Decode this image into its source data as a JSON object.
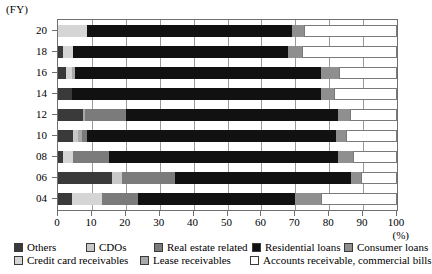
{
  "axis": {
    "y_axis_title": "(FY)",
    "x_axis_unit": "(%)",
    "x_ticks": [
      0,
      10,
      20,
      30,
      40,
      50,
      60,
      70,
      80,
      90,
      100
    ],
    "y_ticks": [
      "20",
      "18",
      "16",
      "14",
      "12",
      "10",
      "08",
      "06",
      "04"
    ]
  },
  "legend": {
    "row1": [
      {
        "label": "Others",
        "color": "#3a3a3a"
      },
      {
        "label": "CDOs",
        "color": "#c8c8c8"
      },
      {
        "label": "Real estate related",
        "color": "#7b7b7b"
      },
      {
        "label": "Residential loans",
        "color": "#111111"
      },
      {
        "label": "Consumer loans",
        "color": "#8f8f8f"
      }
    ],
    "row2": [
      {
        "label": "Credit card receivables",
        "color": "#d5d5d5"
      },
      {
        "label": "Lease receivables",
        "color": "#a8a8a8"
      },
      {
        "label": "Accounts receivable, commercial bills",
        "color": "#ffffff"
      }
    ]
  },
  "chart_data": {
    "type": "bar",
    "orientation": "horizontal",
    "stacked": true,
    "stack_total": 100,
    "title": "",
    "xlabel": "(%)",
    "ylabel": "(FY)",
    "xlim": [
      0,
      100
    ],
    "grid": true,
    "legend_position": "bottom",
    "categories": [
      "20",
      "18",
      "16",
      "14",
      "12",
      "10",
      "08",
      "06",
      "04"
    ],
    "series": [
      {
        "name": "Others",
        "color": "#3a3a3a",
        "values": [
          0.0,
          1.5,
          2.5,
          4.0,
          7.5,
          4.5,
          1.5,
          16.0,
          4.0
        ]
      },
      {
        "name": "CDOs",
        "color": "#c8c8c8",
        "values": [
          0.0,
          0.0,
          0.0,
          0.0,
          0.0,
          1.5,
          0.0,
          3.0,
          0.0
        ]
      },
      {
        "name": "Credit card receivables",
        "color": "#d5d5d5",
        "values": [
          8.5,
          3.0,
          1.5,
          0.0,
          0.0,
          0.0,
          3.0,
          0.0,
          9.0
        ]
      },
      {
        "name": "Lease receivables",
        "color": "#a8a8a8",
        "values": [
          0.0,
          0.0,
          1.0,
          0.0,
          0.5,
          1.0,
          0.0,
          0.0,
          0.0
        ]
      },
      {
        "name": "Real estate related",
        "color": "#7b7b7b",
        "values": [
          0.0,
          0.0,
          0.0,
          0.0,
          12.0,
          1.5,
          10.5,
          15.5,
          10.5
        ]
      },
      {
        "name": "Residential loans",
        "color": "#111111",
        "values": [
          60.5,
          63.5,
          72.5,
          73.5,
          62.5,
          73.5,
          67.5,
          52.0,
          46.5
        ]
      },
      {
        "name": "Consumer loans",
        "color": "#8f8f8f",
        "values": [
          3.5,
          4.0,
          5.5,
          4.0,
          3.5,
          3.0,
          4.5,
          3.0,
          7.5
        ]
      },
      {
        "name": "Accounts receivable, commercial bills",
        "color": "#ffffff",
        "values": [
          27.5,
          28.0,
          17.0,
          18.5,
          14.0,
          15.0,
          13.0,
          10.5,
          22.5
        ]
      }
    ]
  }
}
